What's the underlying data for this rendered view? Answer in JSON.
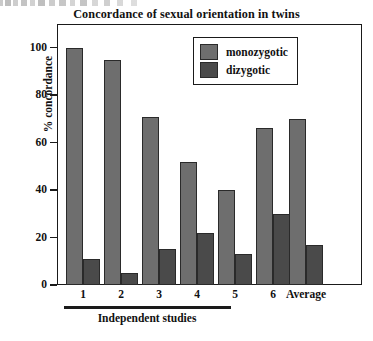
{
  "chart_data": {
    "type": "bar",
    "title": "Concordance of  sexual orientation in twins",
    "xlabel": "Independent studies",
    "ylabel": "% concordance",
    "ylim": [
      0,
      110
    ],
    "yticks": [
      0,
      20,
      40,
      60,
      80,
      100
    ],
    "ytick_labels": [
      "0",
      "20",
      "40",
      "60",
      "80",
      "100"
    ],
    "grid": false,
    "legend_position": "top-right-inside",
    "categories": [
      "1",
      "2",
      "3",
      "4",
      "5",
      "6",
      "Average"
    ],
    "series": [
      {
        "name": "monozygotic",
        "color": "#6e6e6e",
        "values": [
          100,
          95,
          71,
          52,
          40,
          66,
          70
        ]
      },
      {
        "name": "dizygotic",
        "color": "#4a4a4a",
        "values": [
          11,
          5,
          15,
          22,
          13,
          30,
          17
        ]
      }
    ],
    "annotations": [
      {
        "text": "Independent studies",
        "type": "axis-group-bracket",
        "covers": [
          "1",
          "2",
          "3",
          "4",
          "5",
          "6"
        ]
      }
    ]
  },
  "axis": {
    "y_label": "% concordance",
    "x_group_label": "Independent studies"
  },
  "legend": {
    "entries": [
      {
        "label": "monozygotic"
      },
      {
        "label": "dizygotic"
      }
    ]
  },
  "colors": {
    "monozygotic": "#6e6e6e",
    "dizygotic": "#4a4a4a",
    "frame": "#1a1a1a",
    "background": "#ffffff"
  }
}
